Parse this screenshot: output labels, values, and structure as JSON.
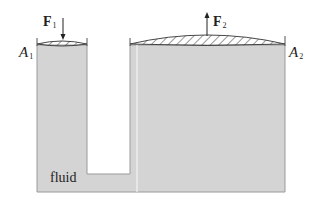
{
  "diagram": {
    "type": "hydraulic-press",
    "labels": {
      "force_left": {
        "symbol": "F",
        "subscript": "1"
      },
      "force_right": {
        "symbol": "F",
        "subscript": "2"
      },
      "area_left": {
        "symbol": "A",
        "subscript": "1"
      },
      "area_right": {
        "symbol": "A",
        "subscript": "2"
      },
      "fluid": "fluid"
    },
    "colors": {
      "fluid": "#d4d4d4",
      "outline": "#8a8a8a",
      "piston_line": "#333333",
      "background": "#ffffff"
    }
  }
}
